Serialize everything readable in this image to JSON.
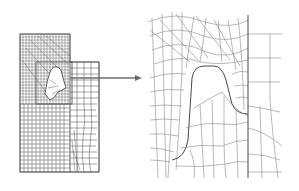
{
  "figure": {
    "panels": [
      {
        "id": "full-mesh",
        "label": ""
      },
      {
        "id": "enlarged-mesh",
        "label": ""
      }
    ],
    "colors": {
      "mesh_line": "#4a4a4a",
      "mesh_line_light": "#8a8a8a",
      "arrow": "#6e6e6e",
      "background": "#ffffff"
    }
  }
}
